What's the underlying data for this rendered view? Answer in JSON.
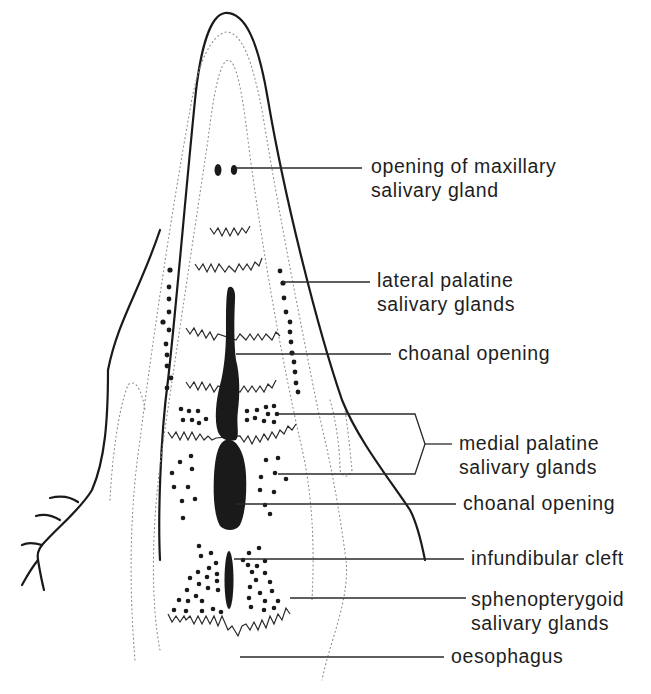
{
  "diagram": {
    "colors": {
      "ink": "#1a1a1a",
      "dotted_outline": "#8a8a8a",
      "background": "#ffffff"
    },
    "labels": [
      {
        "id": "maxillary",
        "line1": "opening of maxillary",
        "line2": "salivary gland"
      },
      {
        "id": "lateral-palatine",
        "line1": "lateral palatine",
        "line2": "salivary glands"
      },
      {
        "id": "choanal-upper",
        "line1": "choanal opening",
        "line2": ""
      },
      {
        "id": "medial-palatine",
        "line1": "medial palatine",
        "line2": "salivary glands"
      },
      {
        "id": "choanal-lower",
        "line1": "choanal opening",
        "line2": ""
      },
      {
        "id": "infundibular",
        "line1": "infundibular cleft",
        "line2": ""
      },
      {
        "id": "sphenopterygoid",
        "line1": "sphenopterygoid",
        "line2": "salivary glands"
      },
      {
        "id": "oesophagus",
        "line1": "oesophagus",
        "line2": ""
      }
    ]
  }
}
